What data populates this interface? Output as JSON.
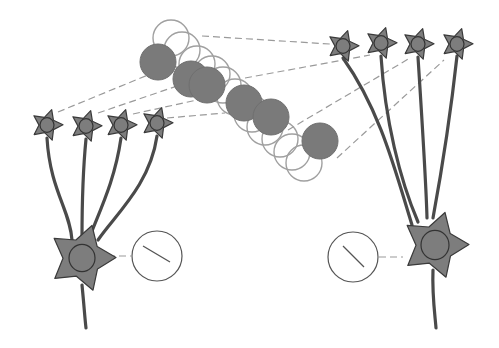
{
  "diagram": {
    "colors": {
      "neuron_fill": "#7d7d7d",
      "neuron_stroke": "#3a3a3a",
      "stimulus_fill": "#7a7a7a",
      "open_circle_stroke": "#a0a0a0",
      "dash_line": "#9a9a9a",
      "background": "#ffffff"
    },
    "left_population": {
      "input_neurons": [
        {
          "x": 47,
          "y": 125
        },
        {
          "x": 86,
          "y": 126
        },
        {
          "x": 121,
          "y": 125
        },
        {
          "x": 157,
          "y": 123
        }
      ],
      "output_neuron": {
        "x": 82,
        "y": 258
      },
      "dial": {
        "x": 157,
        "y": 256,
        "r": 25,
        "orientation": "left-top to right-bottom"
      }
    },
    "right_population": {
      "input_neurons": [
        {
          "x": 343,
          "y": 46
        },
        {
          "x": 381,
          "y": 43
        },
        {
          "x": 418,
          "y": 44
        },
        {
          "x": 457,
          "y": 44
        }
      ],
      "output_neuron": {
        "x": 435,
        "y": 245
      },
      "dial": {
        "x": 353,
        "y": 257,
        "r": 25,
        "orientation": "left-top to right-bottom"
      }
    },
    "filled_circles": [
      {
        "x": 158,
        "y": 62
      },
      {
        "x": 191,
        "y": 79
      },
      {
        "x": 207,
        "y": 85
      },
      {
        "x": 244,
        "y": 103
      },
      {
        "x": 271,
        "y": 117
      },
      {
        "x": 320,
        "y": 141
      }
    ],
    "open_circles": [
      {
        "x": 171,
        "y": 38
      },
      {
        "x": 182,
        "y": 50
      },
      {
        "x": 197,
        "y": 64
      },
      {
        "x": 212,
        "y": 74
      },
      {
        "x": 223,
        "y": 85
      },
      {
        "x": 235,
        "y": 97
      },
      {
        "x": 252,
        "y": 114
      },
      {
        "x": 265,
        "y": 127
      },
      {
        "x": 280,
        "y": 139
      },
      {
        "x": 292,
        "y": 152
      },
      {
        "x": 304,
        "y": 163
      }
    ]
  }
}
